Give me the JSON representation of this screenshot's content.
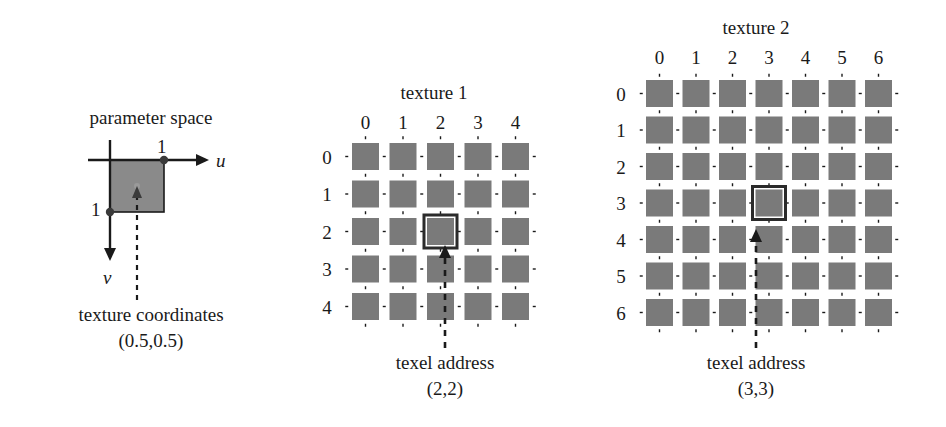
{
  "figure": {
    "background_color": "#ffffff",
    "texel_fill_color": "#7a7a7a",
    "line_color": "#1a1a1a",
    "highlight_color": "#2b2b2b"
  },
  "parameter_space": {
    "title": "parameter space",
    "u_axis_label": "u",
    "v_axis_label": "v",
    "u_tick_label": "1",
    "v_tick_label": "1",
    "caption_line1": "texture coordinates",
    "caption_line2": "(0.5,0.5)",
    "square_fill": "#8a8a8a"
  },
  "texture1": {
    "title": "texture 1",
    "columns": [
      "0",
      "1",
      "2",
      "3",
      "4"
    ],
    "rows": [
      "0",
      "1",
      "2",
      "3",
      "4"
    ],
    "grid_size": 5,
    "highlight_col": 2,
    "highlight_row": 2,
    "caption_line1": "texel address",
    "caption_line2": "(2,2)"
  },
  "texture2": {
    "title": "texture 2",
    "columns": [
      "0",
      "1",
      "2",
      "3",
      "4",
      "5",
      "6"
    ],
    "rows": [
      "0",
      "1",
      "2",
      "3",
      "4",
      "5",
      "6"
    ],
    "grid_size": 7,
    "highlight_col": 3,
    "highlight_row": 3,
    "caption_line1": "texel address",
    "caption_line2": "(3,3)"
  }
}
